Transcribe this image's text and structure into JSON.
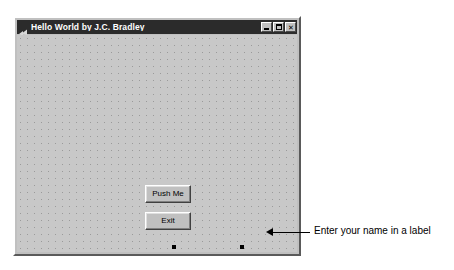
{
  "window": {
    "title": "Hello World by J.C. Bradley",
    "icon": "vb-form-icon",
    "controls": {
      "minimize_label": "",
      "maximize_label": "",
      "close_label": "✕"
    }
  },
  "form": {
    "buttons": [
      {
        "name": "push-me",
        "label": "Push Me"
      },
      {
        "name": "exit",
        "label": "Exit"
      }
    ],
    "label": {
      "name": "label1",
      "text": "Label1",
      "selected": true
    }
  },
  "annotation": {
    "text": "Enter your name in a label",
    "arrow": "arrow-left"
  },
  "colors": {
    "form_face": "#c0c0c0",
    "grid_dot": "#9a9a9a",
    "titlebar": "#2b2b2b",
    "titlebar_text": "#ffffff",
    "annotation_text": "#000000",
    "handle": "#000000"
  }
}
